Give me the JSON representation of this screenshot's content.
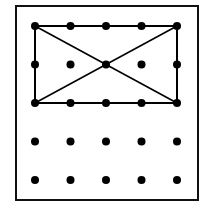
{
  "diagram": {
    "type": "geoboard",
    "frame": {
      "x": 16,
      "y": 6,
      "width": 182,
      "height": 194,
      "stroke": "#111111",
      "stroke_width": 2
    },
    "grid": {
      "rows": 5,
      "cols": 5,
      "origin": {
        "x": 35,
        "y": 26
      },
      "spacing_x": 35.5,
      "spacing_y": 38.5,
      "dot_radius": 4,
      "dot_color": "#000000"
    },
    "shapes": [
      {
        "name": "rectangle",
        "points": [
          [
            0,
            0
          ],
          [
            4,
            0
          ],
          [
            4,
            2
          ],
          [
            0,
            2
          ]
        ],
        "stroke": "#000000",
        "stroke_width": 2
      },
      {
        "name": "diagonal-1",
        "from": [
          0,
          0
        ],
        "to": [
          4,
          2
        ],
        "stroke": "#000000",
        "stroke_width": 1.6
      },
      {
        "name": "diagonal-2",
        "from": [
          4,
          0
        ],
        "to": [
          0,
          2
        ],
        "stroke": "#000000",
        "stroke_width": 1.6
      }
    ]
  }
}
